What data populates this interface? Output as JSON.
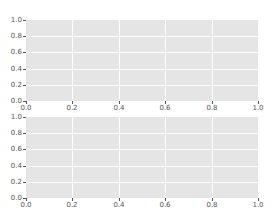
{
  "chart_data": [
    {
      "type": "line",
      "title": "",
      "xlabel": "",
      "ylabel": "",
      "xlim": [
        0.0,
        1.0
      ],
      "ylim": [
        0.0,
        1.0
      ],
      "grid": true,
      "style": "ggplot",
      "series": [],
      "xticks": [
        "0.0",
        "0.2",
        "0.4",
        "0.6",
        "0.8",
        "1.0"
      ],
      "yticks": [
        "0.0",
        "0.2",
        "0.4",
        "0.6",
        "0.8",
        "1.0"
      ]
    },
    {
      "type": "line",
      "title": "",
      "xlabel": "",
      "ylabel": "",
      "xlim": [
        0.0,
        1.0
      ],
      "ylim": [
        0.0,
        1.0
      ],
      "grid": true,
      "style": "ggplot",
      "series": [],
      "xticks": [
        "0.0",
        "0.2",
        "0.4",
        "0.6",
        "0.8",
        "1.0"
      ],
      "yticks": [
        "0.0",
        "0.2",
        "0.4",
        "0.6",
        "0.8",
        "1.0"
      ]
    }
  ],
  "colors": {
    "axes_background": "#e5e5e5",
    "grid": "#ffffff",
    "tick_text": "#555555"
  },
  "axes": [
    {
      "name": "top",
      "xticks": [
        "0.0",
        "0.2",
        "0.4",
        "0.6",
        "0.8",
        "1.0"
      ],
      "yticks": [
        "0.0",
        "0.2",
        "0.4",
        "0.6",
        "0.8",
        "1.0"
      ]
    },
    {
      "name": "bottom",
      "xticks": [
        "0.0",
        "0.2",
        "0.4",
        "0.6",
        "0.8",
        "1.0"
      ],
      "yticks": [
        "0.0",
        "0.2",
        "0.4",
        "0.6",
        "0.8",
        "1.0"
      ]
    }
  ]
}
